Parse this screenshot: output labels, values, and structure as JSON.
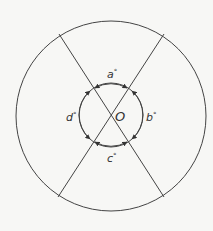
{
  "diagram": {
    "type": "geometry",
    "center_label": "O",
    "angles": [
      {
        "id": "a",
        "label": "a",
        "unit": "°",
        "position": "top"
      },
      {
        "id": "b",
        "label": "b",
        "unit": "°",
        "position": "right"
      },
      {
        "id": "c",
        "label": "c",
        "unit": "°",
        "position": "bottom"
      },
      {
        "id": "d",
        "label": "d",
        "unit": "°",
        "position": "left"
      }
    ],
    "colors": {
      "stroke": "#444444",
      "text": "#333333",
      "background": "#f7f7f5"
    }
  }
}
